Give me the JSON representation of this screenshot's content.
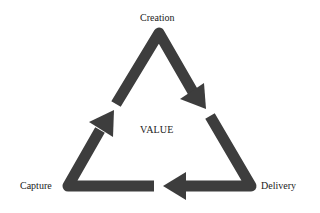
{
  "diagram": {
    "center_label": "VALUE",
    "nodes": [
      {
        "id": "creation",
        "label": "Creation",
        "position": "top"
      },
      {
        "id": "delivery",
        "label": "Delivery",
        "position": "bottom-right"
      },
      {
        "id": "capture",
        "label": "Capture",
        "position": "bottom-left"
      }
    ],
    "edges": [
      {
        "from": "creation",
        "to": "delivery",
        "direction": "clockwise"
      },
      {
        "from": "delivery",
        "to": "capture",
        "direction": "clockwise"
      },
      {
        "from": "capture",
        "to": "creation",
        "direction": "clockwise"
      }
    ],
    "colors": {
      "arrow": "#3d3d3d",
      "background": "#ffffff",
      "text": "#222222"
    }
  }
}
